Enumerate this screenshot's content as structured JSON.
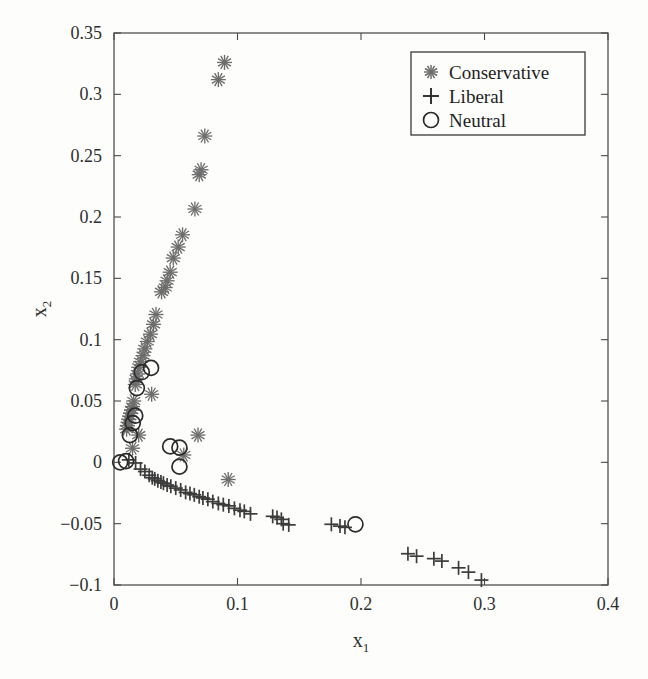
{
  "chart_data": {
    "type": "scatter",
    "title": "",
    "xlabel": "x₁",
    "ylabel": "x₂",
    "xlabel_base": "x",
    "xlabel_sub": "1",
    "ylabel_base": "x",
    "ylabel_sub": "2",
    "xlim": [
      0,
      0.4
    ],
    "ylim": [
      -0.1,
      0.35
    ],
    "xticks": [
      0,
      0.1,
      0.2,
      0.3,
      0.4
    ],
    "xtick_labels": [
      "0",
      "0.1",
      "0.2",
      "0.3",
      "0.4"
    ],
    "yticks": [
      -0.1,
      -0.05,
      0,
      0.05,
      0.1,
      0.15,
      0.2,
      0.25,
      0.3,
      0.35
    ],
    "ytick_labels": [
      "−0.1",
      "−0.05",
      "0",
      "0.05",
      "0.1",
      "0.15",
      "0.2",
      "0.25",
      "0.3",
      "0.35"
    ],
    "grid": false,
    "legend_position": "top-right",
    "legend_entries": [
      {
        "label": "Conservative",
        "marker": "asterisk",
        "color": "#6d6d6d"
      },
      {
        "label": "Liberal",
        "marker": "plus",
        "color": "#3c3c3c"
      },
      {
        "label": "Neutral",
        "marker": "circle",
        "color": "#2b2b2b"
      }
    ],
    "series": [
      {
        "name": "Conservative",
        "marker": "asterisk",
        "color": "#6d6d6d",
        "points": [
          [
            0.0895,
            0.326
          ],
          [
            0.0845,
            0.312
          ],
          [
            0.0735,
            0.266
          ],
          [
            0.0705,
            0.2385
          ],
          [
            0.069,
            0.2345
          ],
          [
            0.0655,
            0.2065
          ],
          [
            0.0555,
            0.1855
          ],
          [
            0.052,
            0.1755
          ],
          [
            0.048,
            0.1665
          ],
          [
            0.0455,
            0.155
          ],
          [
            0.043,
            0.148
          ],
          [
            0.0415,
            0.1425
          ],
          [
            0.0385,
            0.139
          ],
          [
            0.034,
            0.1205
          ],
          [
            0.032,
            0.1125
          ],
          [
            0.0295,
            0.1045
          ],
          [
            0.027,
            0.0985
          ],
          [
            0.025,
            0.0925
          ],
          [
            0.0235,
            0.087
          ],
          [
            0.0215,
            0.082
          ],
          [
            0.02,
            0.0775
          ],
          [
            0.019,
            0.072
          ],
          [
            0.018,
            0.068
          ],
          [
            0.0172,
            0.0635
          ],
          [
            0.0305,
            0.0555
          ],
          [
            0.016,
            0.05
          ],
          [
            0.015,
            0.0455
          ],
          [
            0.0142,
            0.0425
          ],
          [
            0.0135,
            0.04
          ],
          [
            0.0128,
            0.0375
          ],
          [
            0.012,
            0.035
          ],
          [
            0.0115,
            0.0325
          ],
          [
            0.0108,
            0.03
          ],
          [
            0.0102,
            0.027
          ],
          [
            0.02,
            0.0222
          ],
          [
            0.015,
            0.0115
          ],
          [
            0.068,
            0.0222
          ],
          [
            0.0565,
            0.006
          ],
          [
            0.0925,
            -0.014
          ]
        ]
      },
      {
        "name": "Liberal",
        "marker": "plus",
        "color": "#3c3c3c",
        "points": [
          [
            0.012,
            0.002
          ],
          [
            0.0175,
            -0.0005
          ],
          [
            0.0215,
            -0.0055
          ],
          [
            0.025,
            -0.0075
          ],
          [
            0.0285,
            -0.0105
          ],
          [
            0.031,
            -0.0125
          ],
          [
            0.033,
            -0.0135
          ],
          [
            0.0355,
            -0.015
          ],
          [
            0.038,
            -0.016
          ],
          [
            0.04,
            -0.017
          ],
          [
            0.043,
            -0.0185
          ],
          [
            0.046,
            -0.0195
          ],
          [
            0.05,
            -0.021
          ],
          [
            0.054,
            -0.0225
          ],
          [
            0.058,
            -0.0245
          ],
          [
            0.0615,
            -0.0255
          ],
          [
            0.065,
            -0.0265
          ],
          [
            0.069,
            -0.028
          ],
          [
            0.072,
            -0.029
          ],
          [
            0.076,
            -0.03
          ],
          [
            0.08,
            -0.032
          ],
          [
            0.0845,
            -0.0335
          ],
          [
            0.0885,
            -0.0345
          ],
          [
            0.093,
            -0.0355
          ],
          [
            0.0975,
            -0.0375
          ],
          [
            0.102,
            -0.039
          ],
          [
            0.1055,
            -0.04
          ],
          [
            0.1105,
            -0.042
          ],
          [
            0.1285,
            -0.044
          ],
          [
            0.132,
            -0.045
          ],
          [
            0.1355,
            -0.0465
          ],
          [
            0.137,
            -0.05
          ],
          [
            0.1415,
            -0.051
          ],
          [
            0.176,
            -0.0505
          ],
          [
            0.183,
            -0.052
          ],
          [
            0.187,
            -0.053
          ],
          [
            0.238,
            -0.0745
          ],
          [
            0.245,
            -0.0765
          ],
          [
            0.259,
            -0.0785
          ],
          [
            0.2655,
            -0.0805
          ],
          [
            0.279,
            -0.086
          ],
          [
            0.287,
            -0.0895
          ],
          [
            0.2975,
            -0.096
          ]
        ]
      },
      {
        "name": "Neutral",
        "marker": "circle",
        "color": "#2b2b2b",
        "points": [
          [
            0.03,
            0.077
          ],
          [
            0.0225,
            0.0735
          ],
          [
            0.0185,
            0.0605
          ],
          [
            0.0172,
            0.038
          ],
          [
            0.0152,
            0.032
          ],
          [
            0.0128,
            0.0222
          ],
          [
            0.005,
            0.0
          ],
          [
            0.0098,
            0.001
          ],
          [
            0.0455,
            0.013
          ],
          [
            0.053,
            0.012
          ],
          [
            0.053,
            -0.0035
          ],
          [
            0.1955,
            -0.0505
          ]
        ]
      }
    ]
  }
}
